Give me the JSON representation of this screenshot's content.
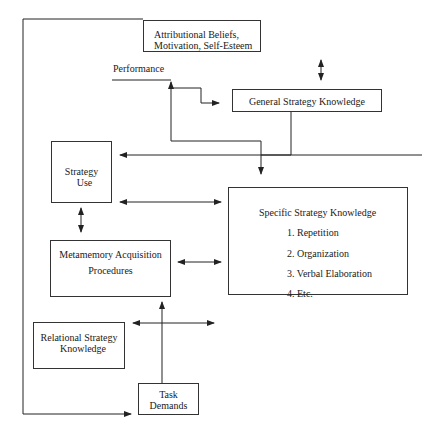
{
  "diagram": {
    "labels": {
      "performance": "Performance"
    },
    "boxes": {
      "attributional": {
        "line1": "Attributional Beliefs,",
        "line2": "Motivation, Self-Esteem"
      },
      "general": {
        "text": "General Strategy Knowledge"
      },
      "strategy_use": {
        "line1": "Strategy",
        "line2": "Use"
      },
      "metamemory": {
        "line1": "Metamemory Acquisition",
        "line2": "Procedures"
      },
      "specific": {
        "title": "Specific Strategy Knowledge",
        "items": [
          "1.  Repetition",
          "2.  Organization",
          "3.  Verbal Elaboration",
          "4.  Etc."
        ]
      },
      "relational": {
        "line1": "Relational Strategy",
        "line2": "Knowledge"
      },
      "task": {
        "line1": "Task",
        "line2": "Demands"
      }
    }
  }
}
